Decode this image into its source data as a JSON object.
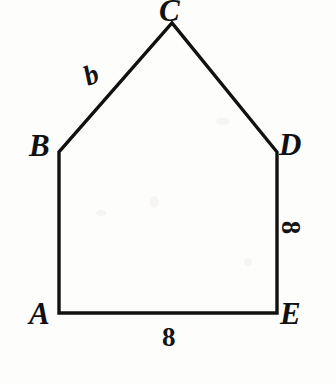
{
  "figure": {
    "kind": "geometry-diagram",
    "shape_name": "pentagon-ABCDE",
    "background_color": "#fdfdfb",
    "stroke_color": "#111111",
    "stroke_width": 3,
    "canvas": {
      "width": 336,
      "height": 384
    },
    "vertices": [
      {
        "id": "A",
        "label": "A",
        "x": 59,
        "y": 313
      },
      {
        "id": "B",
        "label": "B",
        "x": 59,
        "y": 152
      },
      {
        "id": "C",
        "label": "C",
        "x": 172,
        "y": 23
      },
      {
        "id": "D",
        "label": "D",
        "x": 277,
        "y": 152
      },
      {
        "id": "E",
        "label": "E",
        "x": 277,
        "y": 313
      }
    ],
    "edges": [
      {
        "id": "AB",
        "from": "A",
        "to": "B",
        "measure_label": ""
      },
      {
        "id": "BC",
        "from": "B",
        "to": "C",
        "measure_label": "b"
      },
      {
        "id": "CD",
        "from": "C",
        "to": "D",
        "measure_label": ""
      },
      {
        "id": "DE",
        "from": "D",
        "to": "E",
        "measure_label": "8"
      },
      {
        "id": "EA",
        "from": "E",
        "to": "A",
        "measure_label": "8"
      }
    ],
    "side_labels": {
      "bc_label": "b",
      "de_label": "8",
      "ae_label": "8"
    },
    "path_points": "59,313 59,152 172,23 277,152 277,313 59,313"
  }
}
